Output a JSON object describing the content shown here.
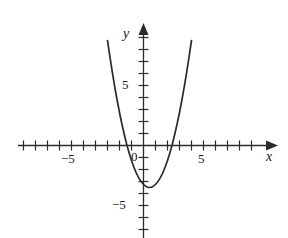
{
  "figure": {
    "name": "parabola-graph",
    "background_color": "#ffffff",
    "stroke_color": "#2b2b2b",
    "text_color": "#1a1a1a"
  },
  "axes": {
    "x_label": "x",
    "y_label": "y",
    "origin_label": "0",
    "x_tick_labels": [
      {
        "text": "−5",
        "value": -5
      },
      {
        "text": "5",
        "value": 5
      }
    ],
    "y_tick_labels": [
      {
        "text": "5",
        "value": 5
      },
      {
        "text": "−5",
        "value": -5
      }
    ]
  },
  "chart_data": {
    "type": "line",
    "title": "",
    "xlabel": "x",
    "ylabel": "y",
    "grid": false,
    "legend": null,
    "xlim": [
      -10,
      10
    ],
    "ylim": [
      -9,
      9
    ],
    "x_tick_interval": 1,
    "y_tick_interval": 1,
    "x_labeled_ticks": [
      -5,
      5
    ],
    "y_labeled_ticks": [
      -5,
      5
    ],
    "curve": {
      "name": "parabola",
      "equation": "y = x^2 - x - 3.25",
      "vertex": [
        0.5,
        -3.5
      ],
      "x_intercepts": [
        -1.31,
        2.31
      ],
      "y_intercept": -3.25,
      "opens": "up",
      "x_domain": [
        -3.8,
        4.8
      ],
      "points": [
        [
          -3.8,
          15.19
        ],
        [
          -3.4,
          11.71
        ],
        [
          -3.0,
          8.75
        ],
        [
          -2.6,
          6.11
        ],
        [
          -2.2,
          3.79
        ],
        [
          -1.8,
          1.79
        ],
        [
          -1.4,
          0.11
        ],
        [
          -1.0,
          -1.25
        ],
        [
          -0.6,
          -2.29
        ],
        [
          -0.2,
          -3.01
        ],
        [
          0.2,
          -3.41
        ],
        [
          0.5,
          -3.5
        ],
        [
          0.8,
          -3.41
        ],
        [
          1.2,
          -3.01
        ],
        [
          1.6,
          -2.29
        ],
        [
          2.0,
          -1.25
        ],
        [
          2.4,
          0.11
        ],
        [
          2.8,
          1.79
        ],
        [
          3.2,
          3.79
        ],
        [
          3.6,
          6.11
        ],
        [
          4.0,
          8.75
        ],
        [
          4.4,
          11.71
        ],
        [
          4.8,
          15.19
        ]
      ]
    }
  }
}
